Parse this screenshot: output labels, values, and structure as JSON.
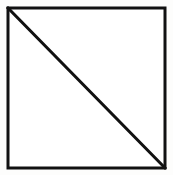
{
  "figure": {
    "name": "square-with-diagonal",
    "title": "Square divided by a diagonal",
    "canvas": {
      "width": 173,
      "height": 175,
      "background_color": "#fdfdfc"
    },
    "style": {
      "line_color": "#111111",
      "fill_color": "#ffffff",
      "outline_width_px": 3,
      "diagonal_width_px": 3
    },
    "square": {
      "label": "square",
      "x": 8,
      "y": 8,
      "width": 157,
      "height": 160,
      "corners": {
        "top_left": [
          8,
          8
        ],
        "top_right": [
          165,
          8
        ],
        "bottom_right": [
          165,
          168
        ],
        "bottom_left": [
          8,
          168
        ]
      }
    },
    "diagonal": {
      "label": "diagonal",
      "from": [
        8,
        8
      ],
      "to": [
        165,
        168
      ],
      "direction": "top-left-to-bottom-right"
    },
    "regions": [
      {
        "label": "upper-right-triangle",
        "points": "8,8 165,8 165,168"
      },
      {
        "label": "lower-left-triangle",
        "points": "8,8 165,168 8,168"
      }
    ]
  }
}
